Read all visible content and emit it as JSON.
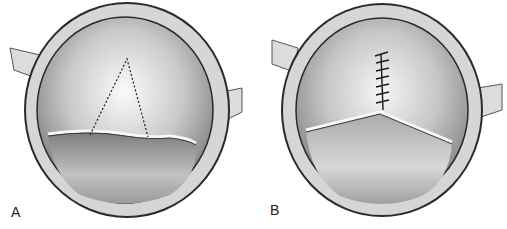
{
  "figure": {
    "panels": [
      {
        "id": "A",
        "label": "A"
      },
      {
        "id": "B",
        "label": "B"
      }
    ],
    "colors": {
      "outline": "#2a2a2a",
      "ring_fill": "#d8d8d8",
      "inner_dark": "#8c8c8c",
      "inner_light": "#f4f4f4",
      "lower_leaflet": "#a8a8a8"
    }
  }
}
